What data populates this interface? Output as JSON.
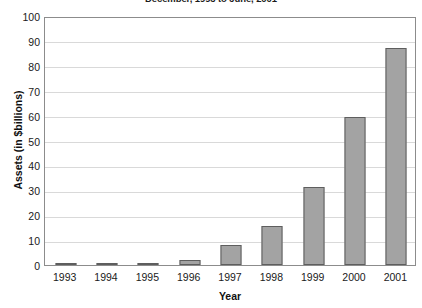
{
  "chart_data": {
    "type": "bar",
    "title": "December, 1993 to June, 2001",
    "xlabel": "Year",
    "ylabel": "Assets (in $billions)",
    "categories": [
      "1993",
      "1994",
      "1995",
      "1996",
      "1997",
      "1998",
      "1999",
      "2000",
      "2001"
    ],
    "values": [
      0.2,
      0.5,
      0.8,
      2,
      8,
      15.5,
      31.5,
      59.5,
      87
    ],
    "ylim": [
      0,
      100
    ],
    "ytick_step": 10,
    "yticks": [
      100,
      90,
      80,
      70,
      60,
      50,
      40,
      30,
      20,
      10,
      0
    ],
    "grid": true,
    "legend": false,
    "series": [
      {
        "name": "Assets",
        "values": [
          0.2,
          0.5,
          0.8,
          2,
          8,
          15.5,
          31.5,
          59.5,
          87
        ]
      }
    ]
  },
  "colors": {
    "bar_fill": "#a3a3a3",
    "bar_border": "#5e5e5e",
    "gridline": "#d9d9d9",
    "axis": "#8c8c8c",
    "plot_background": "#ffffff",
    "text": "#1a1a1a"
  }
}
